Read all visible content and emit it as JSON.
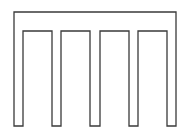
{
  "diagram": {
    "stroke_color": "#3a3a3a",
    "background": "#ffffff",
    "stroke_width": 1.3,
    "outline_points": [
      [
        14,
        12
      ],
      [
        176,
        12
      ],
      [
        176,
        126
      ],
      [
        167,
        126
      ],
      [
        167,
        31
      ],
      [
        138,
        31
      ],
      [
        138,
        126
      ],
      [
        129,
        126
      ],
      [
        129,
        31
      ],
      [
        100,
        31
      ],
      [
        100,
        126
      ],
      [
        90,
        126
      ],
      [
        90,
        31
      ],
      [
        61,
        31
      ],
      [
        61,
        126
      ],
      [
        52,
        126
      ],
      [
        52,
        31
      ],
      [
        23,
        31
      ],
      [
        23,
        126
      ],
      [
        14,
        126
      ]
    ],
    "slots": 4,
    "legs": 5
  }
}
